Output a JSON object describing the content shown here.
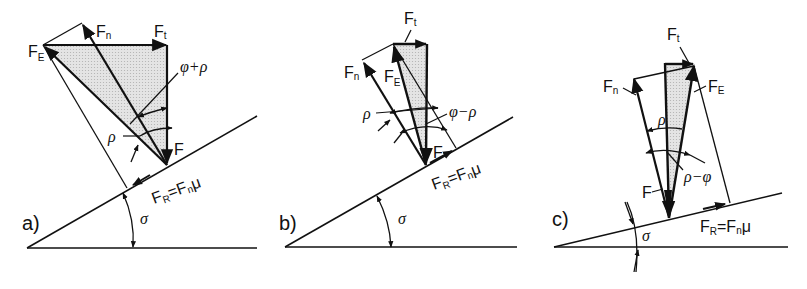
{
  "colors": {
    "ink": "#111111",
    "shade": "#d6d6d6",
    "background": "#ffffff"
  },
  "panels": [
    {
      "id": "a",
      "label": "a)",
      "force_labels": {
        "F_E": "F",
        "F_E_sub": "E",
        "F_n": "F",
        "F_n_sub": "n",
        "F_t": "F",
        "F_t_sub": "t",
        "F": "F",
        "F_R": "F",
        "F_R_sub": "R",
        "F_R_eq": "=F",
        "F_R_eq_sub": "n",
        "F_R_mu": "μ"
      },
      "angle_labels": {
        "outer": "φ+ρ",
        "inner": "ρ",
        "incline": "σ"
      }
    },
    {
      "id": "b",
      "label": "b)",
      "force_labels": {
        "F_E": "F",
        "F_E_sub": "E",
        "F_n": "F",
        "F_n_sub": "n",
        "F_t": "F",
        "F_t_sub": "t",
        "F": "F",
        "F_R": "F",
        "F_R_sub": "R",
        "F_R_eq": "=F",
        "F_R_eq_sub": "n",
        "F_R_mu": "μ"
      },
      "angle_labels": {
        "outer": "φ−ρ",
        "inner": "ρ",
        "incline": "σ"
      }
    },
    {
      "id": "c",
      "label": "c)",
      "force_labels": {
        "F_E": "F",
        "F_E_sub": "E",
        "F_n": "F",
        "F_n_sub": "n",
        "F_t": "F",
        "F_t_sub": "t",
        "F": "F",
        "F_R": "F",
        "F_R_sub": "R",
        "F_R_eq": "=F",
        "F_R_eq_sub": "n",
        "F_R_mu": "μ"
      },
      "angle_labels": {
        "outer": "ρ−φ",
        "inner": "ρ",
        "incline": "σ"
      }
    }
  ]
}
